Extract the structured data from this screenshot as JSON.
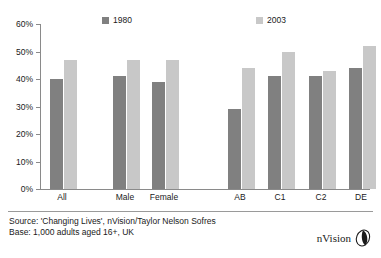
{
  "chart_data": {
    "type": "bar",
    "title": "",
    "xlabel": "",
    "ylabel": "",
    "ylim": [
      0,
      60
    ],
    "ytick_labels": [
      "0%",
      "10%",
      "20%",
      "30%",
      "40%",
      "50%",
      "60%"
    ],
    "ytick_values": [
      0,
      10,
      20,
      30,
      40,
      50,
      60
    ],
    "grid": false,
    "legend_position": "top",
    "categories": [
      "All",
      "Male",
      "Female",
      "AB",
      "C1",
      "C2",
      "DE"
    ],
    "series": [
      {
        "name": "1980",
        "color": "#808080",
        "values": [
          40,
          41,
          39,
          29,
          41,
          41,
          44
        ]
      },
      {
        "name": "2003",
        "color": "#c8c8c8",
        "values": [
          47,
          47,
          47,
          44,
          50,
          43,
          52
        ]
      }
    ]
  },
  "footer": {
    "source_line": "Source: 'Changing Lives', nVision/Taylor Nelson Sofres",
    "base_line": "Base: 1,000 adults aged 16+, UK"
  },
  "logo": {
    "text": "nVision"
  }
}
